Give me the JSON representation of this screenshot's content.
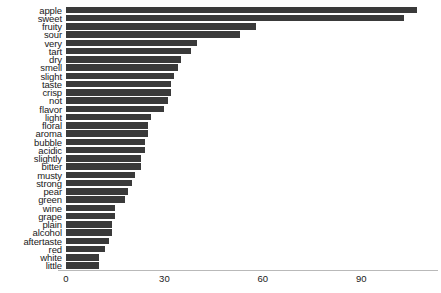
{
  "chart_data": {
    "type": "bar",
    "orientation": "horizontal",
    "title": "",
    "xlabel": "",
    "ylabel": "",
    "xlim": [
      0,
      113
    ],
    "xticks": [
      0,
      30,
      60,
      90
    ],
    "xtick_labels": [
      "0",
      "30",
      "60",
      "90"
    ],
    "grid": false,
    "legend": null,
    "bar_color": "#3a3a3a",
    "background_color": "#ffffff",
    "axis_color": "#b9b9b9",
    "categories": [
      "apple",
      "sweet",
      "fruity",
      "sour",
      "very",
      "tart",
      "dry",
      "smell",
      "slight",
      "taste",
      "crisp",
      "not",
      "flavor",
      "light",
      "floral",
      "aroma",
      "bubble",
      "acidic",
      "slightly",
      "bitter",
      "musty",
      "strong",
      "pear",
      "green",
      "wine",
      "grape",
      "plain",
      "alcohol",
      "aftertaste",
      "red",
      "white",
      "little"
    ],
    "values": [
      107,
      103,
      58,
      53,
      40,
      38,
      35,
      34,
      33,
      32,
      32,
      31,
      30,
      26,
      25,
      25,
      24,
      24,
      23,
      23,
      21,
      20,
      19,
      18,
      15,
      15,
      14,
      14,
      13,
      12,
      10,
      10
    ]
  }
}
